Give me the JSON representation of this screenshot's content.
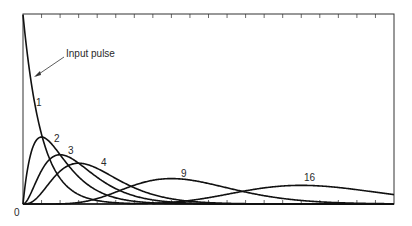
{
  "chart_data": {
    "type": "line",
    "title": "",
    "xlabel": "",
    "ylabel": "",
    "x_origin_label": "0",
    "xlim": [
      0,
      20
    ],
    "ylim": [
      0,
      1.05
    ],
    "grid": false,
    "x_ticks_count": 20,
    "legend": "inline curve labels",
    "annotation": {
      "text": "Input pulse",
      "arrow_target": "curve 1 near t=0.2"
    },
    "model": "gamma response y = t^(n-1) e^(-t) / (n-1)!",
    "series": [
      {
        "name": "1",
        "n": 1,
        "peak_t": 0,
        "peak_value": 1.0
      },
      {
        "name": "2",
        "n": 2,
        "peak_t": 1,
        "peak_value": 0.368
      },
      {
        "name": "3",
        "n": 3,
        "peak_t": 2,
        "peak_value": 0.271
      },
      {
        "name": "4",
        "n": 4,
        "peak_t": 3,
        "peak_value": 0.224
      },
      {
        "name": "9",
        "n": 9,
        "peak_t": 8,
        "peak_value": 0.14
      },
      {
        "name": "16",
        "n": 16,
        "peak_t": 15,
        "peak_value": 0.102
      }
    ]
  },
  "layout": {
    "x0": 23,
    "y0": 204,
    "x1": 394,
    "y_top": 14,
    "px_per_t": 18.55,
    "px_per_y": 182
  },
  "labels": {
    "input_pulse": "Input pulse",
    "origin": "0",
    "curve_1": "1",
    "curve_2": "2",
    "curve_3": "3",
    "curve_4": "4",
    "curve_9": "9",
    "curve_16": "16"
  }
}
